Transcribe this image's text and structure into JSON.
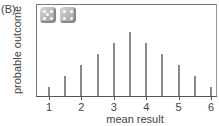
{
  "panel_label": "(B)",
  "chart_data": {
    "type": "bar",
    "title": "",
    "xlabel": "mean result",
    "ylabel": "probable outcome",
    "x": [
      1,
      1.5,
      2,
      2.5,
      3,
      3.5,
      4,
      4.5,
      5,
      5.5,
      6
    ],
    "values": [
      1,
      2,
      3,
      4,
      5,
      6,
      5,
      4,
      3,
      2,
      1
    ],
    "x_tick_labels": [
      "1",
      "2",
      "3",
      "4",
      "5",
      "6"
    ],
    "xlim": [
      0.6,
      6.1
    ],
    "ylim": [
      0,
      8.4
    ],
    "grid": false,
    "legend": "none",
    "annotation": "two dice icons (top-left)"
  },
  "icons": [
    "dice-icon",
    "dice-icon"
  ]
}
